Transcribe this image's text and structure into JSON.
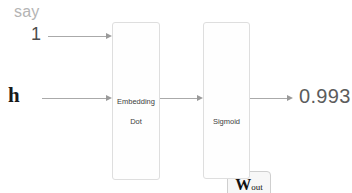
{
  "diagram": {
    "background_color": "#ffffff",
    "inputs": [
      {
        "name": "context-word-label",
        "text": "say",
        "color": "#b4b4b4",
        "role": "word above the one-hot input value"
      },
      {
        "name": "one-hot-value",
        "text": "1",
        "color": "#4c4c4c",
        "role": "target word id / one-hot value"
      },
      {
        "name": "hidden-vector",
        "text": "h",
        "color": "#1a1a1a",
        "role": "hidden layer vector"
      }
    ],
    "nodes": [
      {
        "name": "embedding-dot",
        "lines": [
          "Embedding",
          "Dot"
        ],
        "line1": "Embedding",
        "line2": "Dot",
        "weight_chip": {
          "symbol": "W",
          "subscript": "out"
        }
      },
      {
        "name": "sigmoid",
        "label": "Sigmoid"
      }
    ],
    "output": {
      "name": "probability-value",
      "value": "0.993",
      "color": "#5c5c5c"
    },
    "edges": [
      {
        "from": "1",
        "to": "Embedding Dot"
      },
      {
        "from": "h",
        "to": "Embedding Dot"
      },
      {
        "from": "Embedding Dot",
        "to": "Sigmoid"
      },
      {
        "from": "Sigmoid",
        "to": "0.993"
      }
    ],
    "palette": {
      "arrow": "#aaaaaa",
      "box_border": "#dedede",
      "chip_fill": "#f7f7f7",
      "chip_border": "#cfcfcf"
    }
  }
}
